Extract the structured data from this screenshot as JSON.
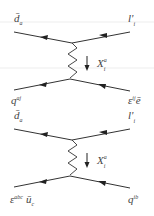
{
  "colors": {
    "line": "#333333",
    "text": "#444444",
    "guide": "#e4e4e4",
    "background": "#ffffff"
  },
  "diagrams": [
    {
      "id": "upper",
      "top_left": {
        "base": "d̄",
        "sub": "a",
        "sup": ""
      },
      "top_right": {
        "base": "l'",
        "sub": "i",
        "sup": ""
      },
      "boson": {
        "base": "X",
        "sup": "a",
        "sub": "i"
      },
      "bottom_left": {
        "base": "q",
        "sup": "aj",
        "sub": "",
        "extra": ""
      },
      "bottom_right": {
        "base": "ε",
        "sup": "ij",
        "sub": "",
        "extra": "ē"
      }
    },
    {
      "id": "lower",
      "top_left": {
        "base": "d̄",
        "sub": "a",
        "sup": ""
      },
      "top_right": {
        "base": "l'",
        "sub": "i",
        "sup": ""
      },
      "boson": {
        "base": "X",
        "sup": "a",
        "sub": "i"
      },
      "bottom_left": {
        "base": "ε",
        "sup": "abc",
        "sub": "",
        "extra": "ū",
        "extra_sub": "c"
      },
      "bottom_right": {
        "base": "q",
        "sup": "ib",
        "sub": "",
        "extra": ""
      }
    }
  ],
  "icons": {
    "propagator_arrow": "down-arrow",
    "fermion_arrow": "left-pointing-triangle"
  }
}
